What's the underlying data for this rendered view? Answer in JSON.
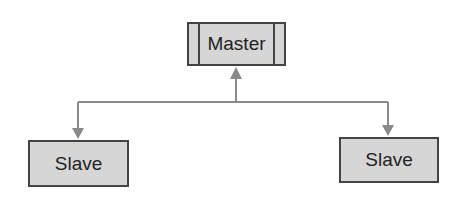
{
  "diagram": {
    "master": {
      "label": "Master"
    },
    "slaves": [
      {
        "label": "Slave"
      },
      {
        "label": "Slave"
      }
    ],
    "colors": {
      "box_fill": "#d6d6d6",
      "box_border": "#444444",
      "connector": "#8a8a8a"
    }
  }
}
